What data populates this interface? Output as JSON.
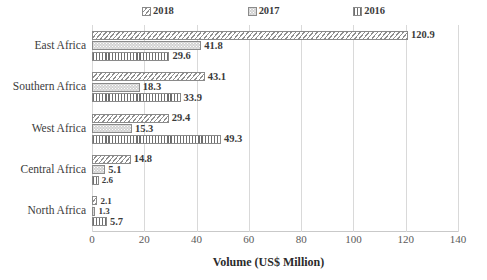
{
  "chart_data": {
    "type": "bar",
    "orientation": "horizontal",
    "title": "",
    "xlabel": "Volume (US$ Million)",
    "ylabel": "",
    "xlim": [
      0,
      140
    ],
    "xticks": [
      0,
      20,
      40,
      60,
      80,
      100,
      120,
      140
    ],
    "grid": true,
    "legend_position": "top",
    "categories": [
      "East Africa",
      "Southern Africa",
      "West Africa",
      "Central Africa",
      "North Africa"
    ],
    "series": [
      {
        "name": "2018",
        "pattern": "diagonal-hatch",
        "values": [
          120.9,
          43.1,
          29.4,
          14.8,
          2.1
        ],
        "labels": [
          "120.9",
          "43.1",
          "29.4",
          "14.8",
          "2.1"
        ]
      },
      {
        "name": "2017",
        "pattern": "dotted-fill",
        "values": [
          41.8,
          18.3,
          15.3,
          5.1,
          1.3
        ],
        "labels": [
          "41.8",
          "18.3",
          "15.3",
          "5.1",
          "1.3"
        ]
      },
      {
        "name": "2016",
        "pattern": "vertical-lines",
        "values": [
          29.6,
          33.9,
          49.3,
          2.6,
          5.7
        ],
        "labels": [
          "29.6",
          "33.9",
          "49.3",
          "2.6",
          "5.7"
        ]
      }
    ]
  },
  "colors": {
    "gridline": "#d9d9d9",
    "bar_outline": "#8a8a8a",
    "text": "#3b3b3b",
    "tick_text": "#5a5a5a"
  }
}
